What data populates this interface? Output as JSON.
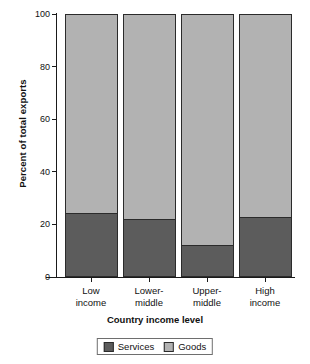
{
  "chart_data": {
    "type": "bar",
    "subtype": "stacked-bar-100",
    "title": "",
    "xlabel": "Country income level",
    "ylabel": "Percent of total exports",
    "categories": [
      "Low income",
      "Lower-middle",
      "Upper-middle",
      "High income"
    ],
    "category_lines": [
      [
        "Low",
        "income"
      ],
      [
        "Lower-",
        "middle"
      ],
      [
        "Upper-",
        "middle"
      ],
      [
        "High",
        "income"
      ]
    ],
    "series": [
      {
        "name": "Services",
        "values": [
          24,
          22,
          12,
          22.5
        ],
        "color": "#5c5c5c"
      },
      {
        "name": "Goods",
        "values": [
          76,
          78,
          88,
          77.5
        ],
        "color": "#b2b2b2"
      }
    ],
    "ylim": [
      0,
      100
    ],
    "yticks": [
      0,
      20,
      40,
      60,
      80,
      100
    ],
    "ytick_labels": [
      "0",
      "20",
      "40",
      "60",
      "80",
      "100"
    ],
    "grid": false,
    "legend_position": "bottom"
  },
  "legend": {
    "items": [
      {
        "label": "Services"
      },
      {
        "label": "Goods"
      }
    ]
  }
}
